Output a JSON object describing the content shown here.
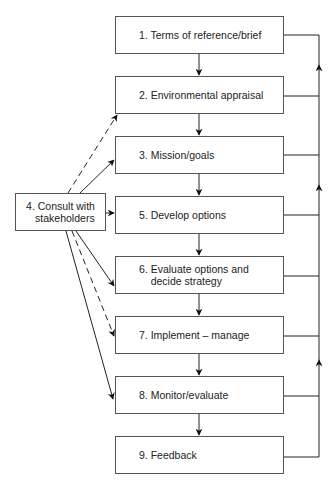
{
  "diagram": {
    "steps": [
      {
        "label": "1. Terms of reference/brief"
      },
      {
        "label": "2. Environmental appraisal"
      },
      {
        "label": "3. Mission/goals"
      },
      {
        "label": "5. Develop options"
      },
      {
        "label": "6. Evaluate options and\n    decide strategy"
      },
      {
        "label": "7. Implement – manage"
      },
      {
        "label": "8. Monitor/evaluate"
      },
      {
        "label": "9. Feedback"
      }
    ],
    "consult": {
      "label": "4. Consult with\n   stakeholders"
    },
    "connections": {
      "sequential": [
        "1→2",
        "2→3",
        "3→5",
        "5→6",
        "6→7",
        "7→8",
        "8→9"
      ],
      "consult_solid": [
        "4→3",
        "4→5",
        "4→6",
        "4→8"
      ],
      "consult_dashed": [
        "4→2",
        "4→7"
      ],
      "feedback_loop": "all steps → right-hand return line (upward arrows)"
    },
    "colors": {
      "line": "#222222",
      "box_border": "#555555",
      "background": "#ffffff"
    }
  }
}
